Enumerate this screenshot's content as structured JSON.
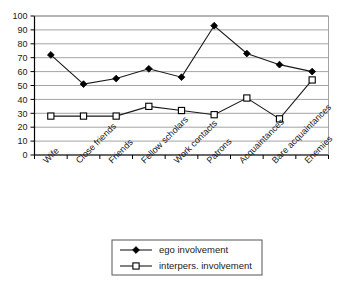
{
  "chart_data": {
    "type": "line",
    "title": "",
    "subtitle": "",
    "xlabel": "",
    "ylabel": "",
    "ylim": [
      0,
      100
    ],
    "ytick_step": 10,
    "yticks": [
      0,
      10,
      20,
      30,
      40,
      50,
      60,
      70,
      80,
      90,
      100
    ],
    "grid": "horizontal",
    "legend_position": "bottom",
    "categories": [
      "Wife",
      "Close friends",
      "Friends",
      "Fellow scholars",
      "Work contacts",
      "Patrons",
      "Acquaintances",
      "Bare acquaintances",
      "Enemies"
    ],
    "series": [
      {
        "name": "ego involvement",
        "marker": "filled-diamond",
        "color": "#000000",
        "values": [
          72,
          51,
          55,
          62,
          56,
          93,
          73,
          65,
          60
        ]
      },
      {
        "name": "interpers. involvement",
        "marker": "open-square",
        "color": "#000000",
        "values": [
          28,
          28,
          28,
          35,
          32,
          29,
          41,
          26,
          54
        ]
      }
    ]
  },
  "legend": {
    "entries": [
      {
        "label": "ego involvement"
      },
      {
        "label": "interpers. involvement"
      }
    ]
  },
  "colors": {
    "background": "#ffffff",
    "gridline": "#8c8c8c",
    "axis": "#000000",
    "series_line": "#1a1a1a",
    "legend_border": "#555555"
  }
}
